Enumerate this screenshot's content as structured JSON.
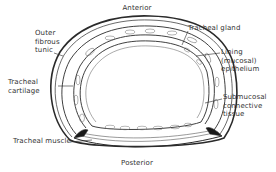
{
  "diagram": {
    "orientation": {
      "top": "Anterior",
      "bottom": "Posterior"
    },
    "labels": {
      "outer_fibrous_tunic": "Outer\nfibrous\ntunic",
      "tracheal_cartilage": "Tracheal\ncartilage",
      "tracheal_muscle": "Tracheal muscle",
      "tracheal_gland": "Tracheal gland",
      "lining_epithelium": "Lining\n(mucosal)\nepithelium",
      "submucosal_tissue": "Submucosal\nconnective\ntissue"
    },
    "colors": {
      "line": "#2a2a2a",
      "fill": "#ffffff",
      "shading": "#bdbdbd"
    }
  }
}
